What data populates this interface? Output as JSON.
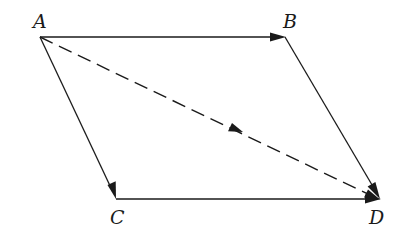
{
  "diagram": {
    "type": "vector-parallelogram",
    "colors": {
      "background": "#ffffff",
      "stroke": "#1a1a1a"
    },
    "vertices": {
      "A": {
        "label": "A",
        "x": 40,
        "y": 37,
        "label_x": 33,
        "label_y": 28
      },
      "B": {
        "label": "B",
        "x": 285,
        "y": 37,
        "label_x": 283,
        "label_y": 28
      },
      "C": {
        "label": "C",
        "x": 116,
        "y": 199,
        "label_x": 110,
        "label_y": 224
      },
      "D": {
        "label": "D",
        "x": 380,
        "y": 199,
        "label_x": 369,
        "label_y": 224
      }
    },
    "edges": [
      {
        "from": "A",
        "to": "B",
        "style": "solid",
        "arrow": "end"
      },
      {
        "from": "A",
        "to": "C",
        "style": "solid",
        "arrow": "end"
      },
      {
        "from": "B",
        "to": "D",
        "style": "solid",
        "arrow": "end"
      },
      {
        "from": "C",
        "to": "D",
        "style": "solid",
        "arrow": "end"
      },
      {
        "from": "A",
        "to": "D",
        "style": "dashed",
        "arrow": "end+mid"
      }
    ]
  }
}
